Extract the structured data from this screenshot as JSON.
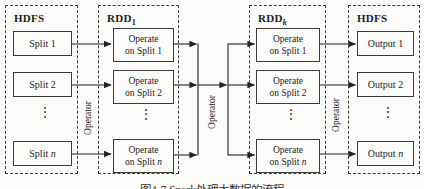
{
  "figure": {
    "caption": "图4-7  Spark处理大数据的流程",
    "dots": "⋮",
    "operators": [
      "Operator",
      "Operator",
      "Operator"
    ],
    "columns": [
      {
        "title": "HDFS",
        "sub": "",
        "rows": [
          {
            "line1": "Split",
            "var": "1"
          },
          {
            "line1": "Split",
            "var": "2"
          },
          {
            "line1": "Split",
            "var": "n"
          }
        ]
      },
      {
        "title": "RDD",
        "sub": "1",
        "rows": [
          {
            "line1": "Operate",
            "line2": "on Split",
            "var": "1"
          },
          {
            "line1": "Operate",
            "line2": "on Split",
            "var": "2"
          },
          {
            "line1": "Operate",
            "line2": "on Split",
            "var": "n"
          }
        ]
      },
      {
        "title": "RDD",
        "sub": "k",
        "rows": [
          {
            "line1": "Operate",
            "line2": "on Split",
            "var": "1"
          },
          {
            "line1": "Operate",
            "line2": "on Split",
            "var": "2"
          },
          {
            "line1": "Operate",
            "line2": "on Split",
            "var": "n"
          }
        ]
      },
      {
        "title": "HDFS",
        "sub": "",
        "rows": [
          {
            "line1": "Output",
            "var": "1"
          },
          {
            "line1": "Output",
            "var": "2"
          },
          {
            "line1": "Output",
            "var": "n"
          }
        ]
      }
    ]
  }
}
